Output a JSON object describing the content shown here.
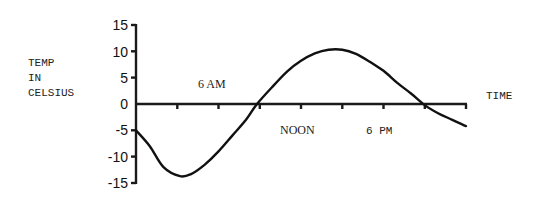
{
  "chart_data": {
    "type": "line",
    "title": "",
    "xlabel": "TIME",
    "ylabel": "TEMP IN CELSIUS",
    "ylabel_lines": [
      "TEMP",
      "IN",
      "CELSIUS"
    ],
    "ylim": [
      -15,
      15
    ],
    "xlim": [
      0,
      24
    ],
    "x_unit": "hours after midnight",
    "y_ticks": [
      15,
      10,
      5,
      0,
      -5,
      -10,
      -15
    ],
    "x_ticks_hours": [
      0,
      3,
      6,
      9,
      12,
      15,
      18,
      21,
      24
    ],
    "x_tick_labels": [
      {
        "hour": 6,
        "label": "6 AM"
      },
      {
        "hour": 12,
        "label": "NOON"
      },
      {
        "hour": 18,
        "label": "6 PM"
      }
    ],
    "grid": false,
    "legend": null,
    "series": [
      {
        "name": "Temperature",
        "x": [
          0,
          1,
          2,
          3.2,
          4,
          5,
          6,
          7,
          8,
          8.8,
          10,
          11,
          12,
          13,
          14,
          15,
          16,
          17,
          18,
          19,
          20,
          21,
          22,
          23,
          24
        ],
        "values": [
          -5,
          -8,
          -12,
          -13.7,
          -13.3,
          -11.5,
          -9,
          -6,
          -3,
          0,
          3.5,
          6.2,
          8.2,
          9.6,
          10.3,
          10.3,
          9.5,
          8,
          6.3,
          4,
          2,
          -0.2,
          -1.8,
          -3,
          -4.2
        ]
      }
    ]
  },
  "labels": {
    "ylabel_1": "TEMP",
    "ylabel_2": "IN",
    "ylabel_3": "CELSIUS",
    "xlabel": "TIME",
    "am6": "6 AM",
    "noon": "NOON",
    "pm6": "6 PM",
    "y15": "15",
    "y10": "10",
    "y5": "5",
    "y0": "0",
    "ym5": "-5",
    "ym10": "-10",
    "ym15": "-15"
  }
}
